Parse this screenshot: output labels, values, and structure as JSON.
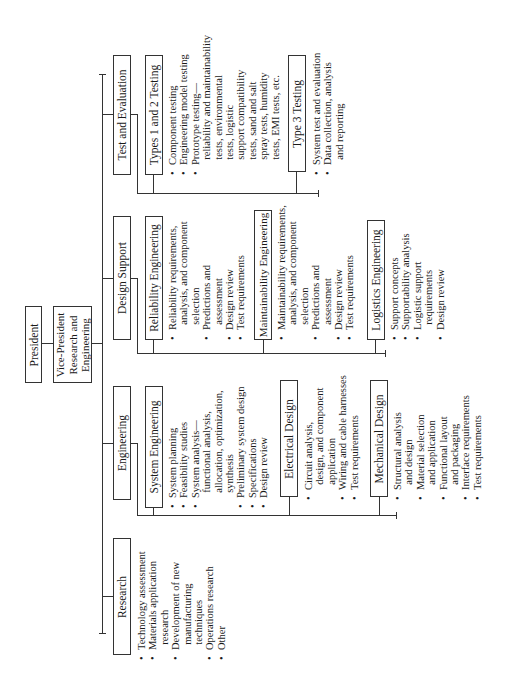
{
  "president": {
    "label": "President"
  },
  "vice_president": {
    "label": "Vice-President\nResearch and\nEngineering"
  },
  "departments": [
    {
      "label": "Research",
      "items": [
        "Technology assessment",
        "Materials application\n  research",
        "Development of new\n  manufacturing\n  techniques",
        "Operations research",
        "Other"
      ]
    },
    {
      "label": "Engineering",
      "groups": [
        {
          "label": "System  Engineering",
          "items": [
            "System planning",
            "Feasibility studies",
            "System analysis—\n  functional analysis,\n  allocation, optimization,\n  synthesis",
            "Preliminary system design",
            "Specifications",
            "Design review"
          ]
        },
        {
          "label": "Electrical Design",
          "items": [
            "Circuit analysis,\n  design, and component\n  application",
            "Wiring and cable harnesses",
            "Test requirements"
          ]
        },
        {
          "label": "Mechanical Design",
          "items": [
            "Structural analysis\n  and design",
            "Material selection\n  and application",
            "Functional layout\n  and packaging",
            "Interface requirements",
            "Test requirements"
          ]
        }
      ]
    },
    {
      "label": "Design Support",
      "groups": [
        {
          "label": "Reliability  Engineering",
          "items": [
            "Reliability requirements,\n  analysis, and component\n  selection",
            "Predictions and\n  assessment",
            "Design review",
            "Test requirements"
          ]
        },
        {
          "label": "Maintainability Engineering",
          "items": [
            "Maintainability requirements,\n  analysis, and component\n  selection",
            "Predictions and\n  assessment",
            "Design review",
            "Test requirements"
          ]
        },
        {
          "label": "Logistics Engineering",
          "items": [
            "Support concepts",
            "Supportability analysis",
            "Logistic support\n  requirements",
            "Design review"
          ]
        }
      ]
    },
    {
      "label": "Test and Evaluation",
      "groups": [
        {
          "label": "Types 1 and 2 Testing",
          "items": [
            "Component testing",
            "Engineering model testing",
            "Prototype testing—\n  reliability and maintainability\n  tests, environmental\n  tests, logistic\n  support compatibility\n  tests, sand and salt\n  spray tests, humidity\n  tests, EMI tests, etc."
          ]
        },
        {
          "label": "Type 3 Testing",
          "items": [
            "System test and evaluation",
            "Data collection, analysis\n  and reporting"
          ]
        }
      ]
    }
  ]
}
